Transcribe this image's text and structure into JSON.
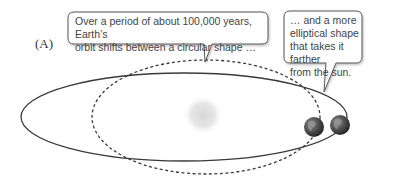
{
  "panel": {
    "label": "(A)"
  },
  "bubbles": [
    {
      "id": "circular",
      "lines": [
        "Over a period of about 100,000 years, Earth’s",
        "orbit shifts between a circular shape …"
      ]
    },
    {
      "id": "elliptical",
      "lines": [
        "… and a more",
        "elliptical shape",
        "that takes it farther",
        "from the sun."
      ]
    }
  ],
  "elements": {
    "sun": "sun-icon",
    "earth": "earth-icon",
    "circular_orbit": "dashed circular orbit",
    "elliptical_orbit": "solid elliptical orbit"
  },
  "colors": {
    "line": "#3a3a3a",
    "bubble_border": "#555555",
    "sun": "#dcdcdc",
    "earth": "#4a4a4a"
  }
}
